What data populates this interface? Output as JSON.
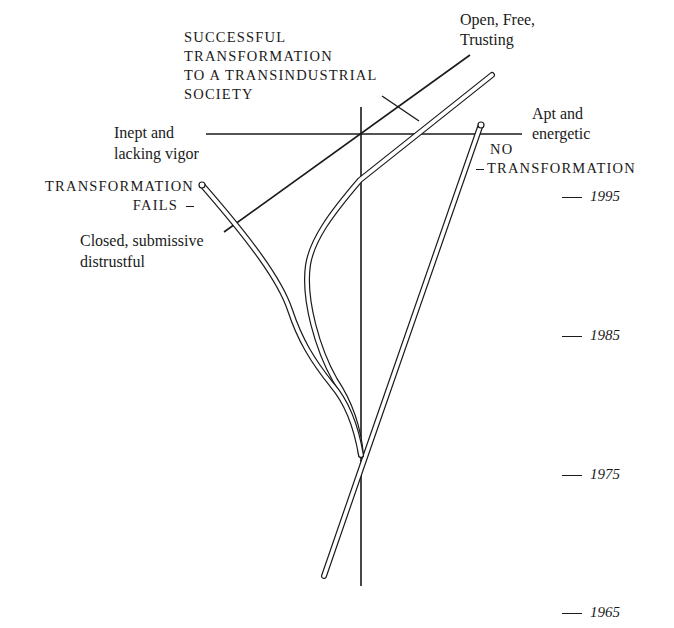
{
  "diagram": {
    "colors": {
      "ink": "#1a1a1a",
      "paper": "#ffffff"
    },
    "axes": {
      "vertical": "time axis (upward = later)",
      "horizontal_left": "Inept and lacking vigor",
      "horizontal_right": "Apt and energetic",
      "diagonal_lower_left": "Closed, submissive distrustful",
      "diagonal_upper_right": "Open, Free, Trusting"
    },
    "labels": {
      "successful": [
        "SUCCESSFUL",
        "TRANSFORMATION",
        "TO A TRANSINDUSTRIAL",
        "SOCIETY"
      ],
      "open_free": [
        "Open, Free,",
        "Trusting"
      ],
      "inept": [
        "Inept and",
        "lacking vigor"
      ],
      "apt": [
        "Apt and",
        "energetic"
      ],
      "fails": [
        "TRANSFORMATION",
        "FAILS"
      ],
      "closed": [
        "Closed, submissive",
        "distrustful"
      ],
      "no_transformation": [
        "NO",
        "TRANSFORMATION"
      ]
    },
    "years": [
      "1995",
      "1985",
      "1975",
      "1965"
    ],
    "paths": [
      {
        "name": "successful-transformation-path",
        "outcome": "SUCCESSFUL TRANSFORMATION TO A TRANSINDUSTRIAL SOCIETY"
      },
      {
        "name": "transformation-fails-path",
        "outcome": "TRANSFORMATION FAILS"
      },
      {
        "name": "no-transformation-path",
        "outcome": "NO TRANSFORMATION"
      }
    ]
  }
}
